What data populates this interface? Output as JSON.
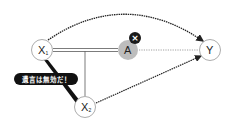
{
  "diagram": {
    "nodes": [
      {
        "id": "X1",
        "label": "X",
        "subscript": "1",
        "x": 42,
        "y": 50
      },
      {
        "id": "A",
        "label": "A",
        "subscript": "",
        "x": 128,
        "y": 50,
        "fill": "#bdbdbd"
      },
      {
        "id": "Y",
        "label": "Y",
        "subscript": "",
        "x": 210,
        "y": 50
      },
      {
        "id": "X2",
        "label": "X",
        "subscript": "2",
        "x": 85,
        "y": 107
      }
    ],
    "edges": [
      {
        "from": "X1",
        "to": "A",
        "style": "double-line"
      },
      {
        "from": "X1-A-line",
        "to": "X2",
        "style": "solid"
      },
      {
        "from": "A",
        "to": "Y",
        "style": "dotted"
      },
      {
        "from": "X1",
        "to": "Y",
        "style": "dashed-arc-arrow"
      },
      {
        "from": "X2",
        "to": "Y",
        "style": "dashed-arrow"
      }
    ],
    "badge": {
      "icon": "close-icon",
      "glyph": "×",
      "color": "#1a1a1a"
    },
    "callout": {
      "text": "遺言は無効だ！",
      "background": "#111111",
      "text_color": "#ffffff"
    }
  }
}
